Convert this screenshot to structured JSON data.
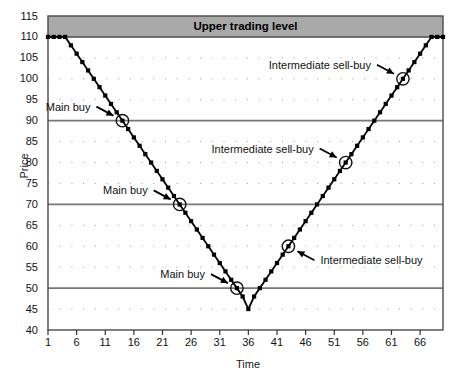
{
  "chart_data": {
    "type": "line",
    "title": "",
    "xlabel": "Time",
    "ylabel": "Price",
    "xlim": [
      1,
      70
    ],
    "ylim": [
      40,
      115
    ],
    "xticks": [
      1,
      6,
      11,
      16,
      21,
      26,
      31,
      36,
      41,
      46,
      51,
      56,
      61,
      66
    ],
    "yticks": [
      40,
      45,
      50,
      55,
      60,
      65,
      70,
      75,
      80,
      85,
      90,
      95,
      100,
      105,
      110,
      115
    ],
    "grid": "dotted minor, solid at 50/70/90",
    "legend": "none",
    "series": [
      {
        "name": "Price",
        "x": [
          1,
          2,
          3,
          4,
          5,
          6,
          7,
          8,
          9,
          10,
          11,
          12,
          13,
          14,
          15,
          16,
          17,
          18,
          19,
          20,
          21,
          22,
          23,
          24,
          25,
          26,
          27,
          28,
          29,
          30,
          31,
          32,
          33,
          34,
          35,
          36,
          37,
          38,
          39,
          40,
          41,
          42,
          43,
          44,
          45,
          46,
          47,
          48,
          49,
          50,
          51,
          52,
          53,
          54,
          55,
          56,
          57,
          58,
          59,
          60,
          61,
          62,
          63,
          64,
          65,
          66,
          67,
          68,
          69,
          70
        ],
        "values": [
          110,
          110,
          110,
          110,
          108,
          106,
          104,
          102,
          100,
          98,
          96,
          94,
          92,
          90,
          88,
          86,
          84,
          82,
          80,
          78,
          76,
          74,
          72,
          70,
          68,
          66,
          64,
          62,
          60,
          58,
          56,
          54,
          52,
          50,
          48,
          45,
          48,
          50,
          52,
          54,
          56,
          58,
          60,
          62,
          64,
          66,
          68,
          70,
          72,
          74,
          76,
          78,
          80,
          82,
          84,
          86,
          88,
          90,
          92,
          94,
          96,
          98,
          100,
          102,
          104,
          106,
          108,
          110,
          110,
          110
        ]
      }
    ],
    "bands": [
      {
        "label": "Upper trading level",
        "from": 110,
        "to": 115,
        "color": "#a9a9a9"
      }
    ],
    "annotations": [
      {
        "label": "Main buy",
        "x": 14,
        "y": 90,
        "label_side": "left"
      },
      {
        "label": "Main buy",
        "x": 24,
        "y": 70,
        "label_side": "left"
      },
      {
        "label": "Main buy",
        "x": 34,
        "y": 50,
        "label_side": "left"
      },
      {
        "label": "Intermediate sell-buy",
        "x": 43,
        "y": 60,
        "label_side": "right"
      },
      {
        "label": "Intermediate sell-buy",
        "x": 53,
        "y": 80,
        "label_side": "left"
      },
      {
        "label": "Intermediate sell-buy",
        "x": 63,
        "y": 100,
        "label_side": "left"
      }
    ]
  },
  "axis": {
    "y_title": "Price",
    "x_title": "Time",
    "y_labels": [
      "115",
      "110",
      "105",
      "100",
      "95",
      "90",
      "85",
      "80",
      "75",
      "70",
      "65",
      "60",
      "55",
      "50",
      "45",
      "40"
    ],
    "x_labels": [
      "1",
      "6",
      "11",
      "16",
      "21",
      "26",
      "31",
      "36",
      "41",
      "46",
      "51",
      "56",
      "61",
      "66"
    ]
  },
  "band_label": "Upper trading level",
  "annotation_labels": {
    "main_buy_1": "Main buy",
    "main_buy_2": "Main buy",
    "main_buy_3": "Main buy",
    "inter_1": "Intermediate sell-buy",
    "inter_2": "Intermediate sell-buy",
    "inter_3": "Intermediate sell-buy"
  },
  "title_sliver": ""
}
